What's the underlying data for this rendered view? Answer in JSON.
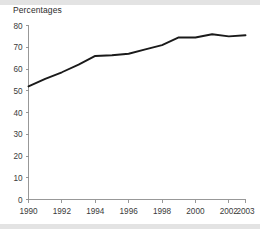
{
  "chart_data": {
    "type": "line",
    "title": "Percentages",
    "xlabel": "",
    "ylabel": "",
    "x": [
      1990,
      1991,
      1992,
      1993,
      1994,
      1995,
      1996,
      1997,
      1998,
      1999,
      2000,
      2001,
      2002,
      2003
    ],
    "series": [
      {
        "name": "Percentage",
        "values": [
          52,
          55.5,
          58.5,
          62,
          66,
          66.3,
          67,
          69,
          71,
          74.5,
          74.5,
          76,
          75,
          75.5
        ]
      }
    ],
    "xlim": [
      1990,
      2003
    ],
    "ylim": [
      0,
      80
    ],
    "ytick_values": [
      0,
      10,
      20,
      30,
      40,
      50,
      60,
      70,
      80
    ],
    "ytick_labels": [
      "0",
      "10",
      "20",
      "30",
      "40",
      "50",
      "60",
      "70",
      "80"
    ],
    "xtick_values": [
      1990,
      1992,
      1994,
      1996,
      1998,
      2000,
      2002,
      2003
    ],
    "xtick_labels": [
      "1990",
      "1992",
      "1994",
      "1996",
      "1998",
      "2000",
      "2002",
      "2003"
    ],
    "grid": false,
    "legend": false,
    "line_color": "#1a1a1a",
    "axis_color": "#8d8d8d",
    "background_color": "#ffffff"
  }
}
